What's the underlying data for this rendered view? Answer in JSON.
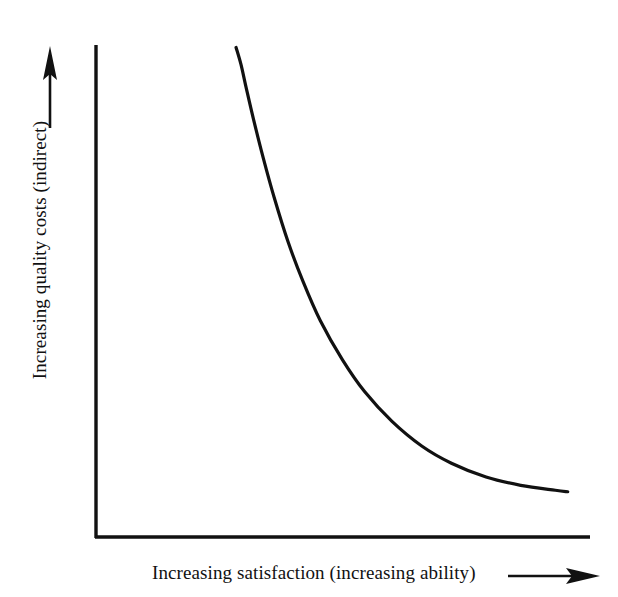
{
  "figure": {
    "background_color": "#ffffff",
    "ink_color": "#111111"
  },
  "axes": {
    "y_label": "Increasing quality costs (indirect)",
    "x_label": "Increasing satisfaction (increasing ability)",
    "y_arrow_icon": "arrow-up-icon",
    "x_arrow_icon": "arrow-right-icon"
  },
  "chart_data": {
    "type": "line",
    "title": "",
    "subtitle": "",
    "xlabel": "Increasing satisfaction (increasing ability)",
    "ylabel": "Increasing quality costs (indirect)",
    "grid": false,
    "legend": null,
    "legend_position": "none",
    "axis_ticks": false,
    "tick_labels_x": [],
    "tick_labels_y": [],
    "xlim": [
      0,
      1
    ],
    "ylim": [
      0,
      1
    ],
    "annotations": [],
    "series": [
      {
        "name": "quality costs",
        "shape": "decaying-hyperbola",
        "line_color": "#111111",
        "line_width_px": 3.2,
        "x": [
          0.285,
          0.295,
          0.305,
          0.32,
          0.34,
          0.362,
          0.39,
          0.42,
          0.455,
          0.5,
          0.545,
          0.6,
          0.66,
          0.72,
          0.79,
          0.86,
          0.93,
          0.955
        ],
        "y": [
          0.995,
          0.96,
          0.915,
          0.85,
          0.77,
          0.69,
          0.6,
          0.52,
          0.44,
          0.36,
          0.295,
          0.235,
          0.185,
          0.15,
          0.122,
          0.105,
          0.095,
          0.092
        ]
      }
    ]
  },
  "geometry": {
    "plot_left_px": 95,
    "plot_right_px": 590,
    "plot_top_px": 45,
    "plot_bottom_px": 537,
    "curve_start": {
      "x": 235,
      "y": 48
    },
    "curve_end": {
      "x": 566,
      "y": 494
    }
  }
}
